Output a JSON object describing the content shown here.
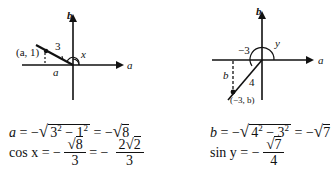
{
  "left_diagram": {
    "axis_b_label": "b",
    "axis_a_label": "a",
    "point_label": "(a, 1)",
    "hypotenuse_label": "3",
    "angle_label": "x",
    "horizontal_leg_label": "a"
  },
  "right_diagram": {
    "axis_b_label": "b",
    "axis_a_label": "a",
    "point_label": "(−3, b)",
    "horizontal_leg_label": "−3",
    "hypotenuse_label": "4",
    "vertical_leg_label": "b",
    "angle_label": "y"
  },
  "left_equations": {
    "line1": {
      "lhs": "a",
      "eq1": "= −",
      "radicand_base1": "3",
      "exp1": "2",
      "minus": " − ",
      "radicand_base2": "1",
      "exp2": "2",
      "eq2": "= −",
      "result_radicand": "8"
    },
    "line2": {
      "lhs": "cos x",
      "eq1": "= −",
      "frac1_num_radicand": "8",
      "frac1_den": "3",
      "eq2": "= −",
      "frac2_num_coef": "2",
      "frac2_num_radicand": "2",
      "frac2_den": "3"
    }
  },
  "right_equations": {
    "line1": {
      "lhs": "b",
      "eq1": "= −",
      "radicand_base1": "4",
      "exp1": "2",
      "minus": " − ",
      "radicand_base2": "3",
      "exp2": "2",
      "eq2": "= −",
      "result_radicand": "7"
    },
    "line2": {
      "lhs": "sin y",
      "eq1": "= −",
      "frac_num_radicand": "7",
      "frac_den": "4"
    }
  },
  "sqrt_symbol": "√"
}
